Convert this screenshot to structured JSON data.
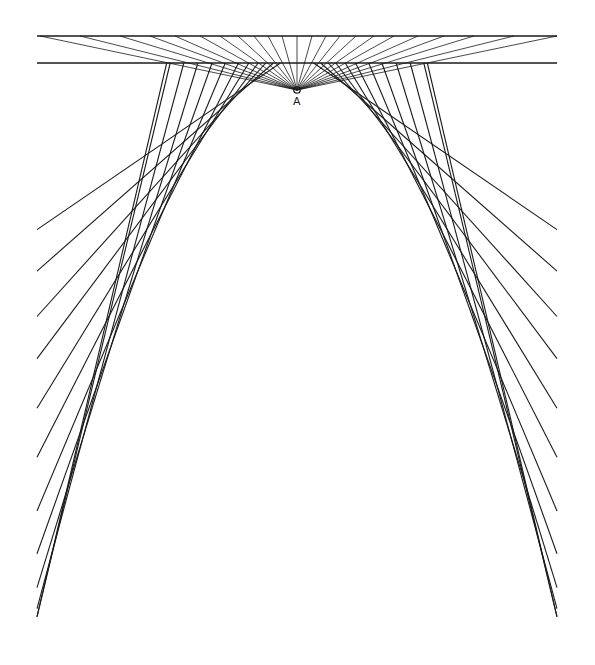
{
  "diagram": {
    "title": "",
    "focus_label": "A",
    "stroke_color": "#1a1a1a",
    "background": "#ffffff",
    "focus": {
      "x": 297,
      "y": 90
    },
    "top_line": {
      "x1": 37,
      "x2": 557,
      "y": 36
    },
    "second_line": {
      "x1": 37,
      "x2": 557,
      "y": 63
    },
    "parabola": {
      "vertex_x": 297,
      "vertex_y": 66,
      "k": 0.00815,
      "left_x": 37,
      "right_x": 557,
      "bottom_y": 626
    },
    "tangent_params": [
      -262,
      -255,
      -228,
      -200,
      -172,
      -146,
      -120,
      -100,
      -82,
      -68,
      -54,
      -42,
      42,
      54,
      68,
      82,
      100,
      120,
      146,
      172,
      200,
      228,
      255,
      262
    ],
    "fan_targets_x": [
      40,
      80,
      120,
      150,
      175,
      200,
      220,
      238,
      254,
      268,
      282,
      297,
      312,
      326,
      340,
      356,
      374,
      394,
      418,
      444,
      474,
      514,
      557
    ]
  }
}
